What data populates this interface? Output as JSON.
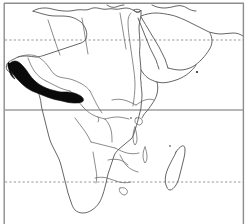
{
  "figure": {
    "type": "distribution-map",
    "region": "Africa",
    "title": "",
    "caption": "",
    "labels": [],
    "width_px": 248,
    "height_px": 224,
    "background_color": "#ffffff"
  },
  "colors": {
    "coastline": "#4a4a4a",
    "internal_border": "#5a5a5a",
    "range_shading": "#0a0a0a",
    "frame": "#8d8d8d",
    "equator": "#6f6f6f",
    "tropic": "#8a8a8a",
    "background": "#ffffff"
  },
  "frame": {
    "left_x": 4,
    "right_x": 244,
    "top_y": 3,
    "bottom_y": 224,
    "has_top": true,
    "has_left": true,
    "has_right": true,
    "has_bottom": false
  },
  "latitude_lines": [
    {
      "name": "tropic-of-cancer",
      "style": "dashed",
      "y_px": 40,
      "label": ""
    },
    {
      "name": "equator",
      "style": "solid",
      "y_px": 110,
      "label": ""
    },
    {
      "name": "tropic-of-capricorn",
      "style": "dashed",
      "y_px": 182,
      "label": ""
    }
  ],
  "features": {
    "continent": "Africa",
    "shaded_range": {
      "name": "west-african-coastal-range",
      "description": "Solid black distribution band along the Upper Guinea / Gulf of Guinea coast",
      "fill": "#0a0a0a"
    },
    "islands": [
      {
        "name": "madagascar",
        "visible": true
      },
      {
        "name": "socotra-dot",
        "visible": true,
        "x_px": 197,
        "y_px": 72
      },
      {
        "name": "lake-islet-marks",
        "visible": true
      }
    ],
    "adjacent_landmasses": [
      {
        "name": "arabian-peninsula",
        "visible": true
      },
      {
        "name": "southern-europe-fragment",
        "visible": true
      },
      {
        "name": "red-sea",
        "visible": true
      }
    ]
  },
  "chart_data": {
    "type": "map",
    "title": "",
    "xlabel": "",
    "ylabel": "",
    "projection": "equirectangular-approx",
    "grid": false,
    "legend": "none",
    "gridlines": [
      {
        "label": "Tropic of Cancer",
        "value": 23.5,
        "style": "dashed"
      },
      {
        "label": "Equator",
        "value": 0,
        "style": "solid"
      },
      {
        "label": "Tropic of Capricorn",
        "value": -23.5,
        "style": "dashed"
      }
    ],
    "series": [
      {
        "name": "shaded distribution range",
        "color": "#0a0a0a",
        "region": "West Africa / Gulf of Guinea coast"
      }
    ]
  }
}
